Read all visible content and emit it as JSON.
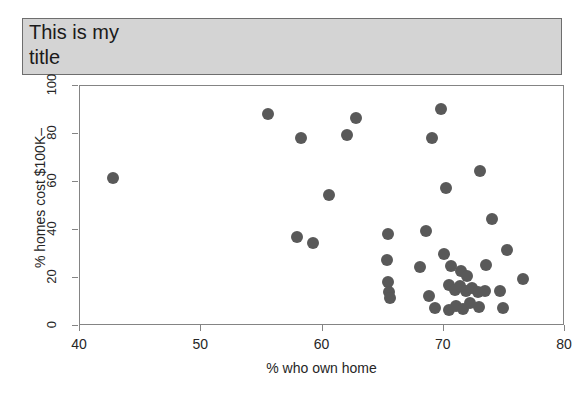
{
  "chart_data": {
    "type": "scatter",
    "title": "This is my\ntitle",
    "xlabel": "% who own home",
    "ylabel": "% homes cost $100K–",
    "xlim": [
      40,
      80
    ],
    "ylim": [
      0,
      100
    ],
    "xticks": [
      40,
      50,
      60,
      70,
      80
    ],
    "yticks": [
      0,
      20,
      40,
      60,
      80,
      100
    ],
    "grid": false,
    "legend": null,
    "marker": {
      "shape": "circle",
      "color": "#595959",
      "size": 12
    },
    "points": [
      {
        "x": 42.7,
        "y": 61.5
      },
      {
        "x": 55.5,
        "y": 88.5
      },
      {
        "x": 58.2,
        "y": 78.5
      },
      {
        "x": 62.0,
        "y": 79.5
      },
      {
        "x": 62.8,
        "y": 86.5
      },
      {
        "x": 69.8,
        "y": 90.5
      },
      {
        "x": 69.0,
        "y": 78.5
      },
      {
        "x": 73.0,
        "y": 64.5
      },
      {
        "x": 70.2,
        "y": 57.5
      },
      {
        "x": 60.5,
        "y": 54.5
      },
      {
        "x": 74.0,
        "y": 44.5
      },
      {
        "x": 57.9,
        "y": 37.0
      },
      {
        "x": 59.2,
        "y": 34.5
      },
      {
        "x": 65.4,
        "y": 38.5
      },
      {
        "x": 68.5,
        "y": 39.5
      },
      {
        "x": 65.3,
        "y": 27.5
      },
      {
        "x": 70.0,
        "y": 30.0
      },
      {
        "x": 75.2,
        "y": 31.5
      },
      {
        "x": 65.4,
        "y": 18.5
      },
      {
        "x": 68.0,
        "y": 24.5
      },
      {
        "x": 70.6,
        "y": 25.0
      },
      {
        "x": 71.4,
        "y": 23.0
      },
      {
        "x": 71.9,
        "y": 21.0
      },
      {
        "x": 73.5,
        "y": 25.5
      },
      {
        "x": 76.5,
        "y": 19.5
      },
      {
        "x": 65.5,
        "y": 14.0
      },
      {
        "x": 65.6,
        "y": 11.5
      },
      {
        "x": 68.8,
        "y": 12.5
      },
      {
        "x": 70.4,
        "y": 17.0
      },
      {
        "x": 70.9,
        "y": 15.0
      },
      {
        "x": 71.3,
        "y": 16.5
      },
      {
        "x": 71.8,
        "y": 14.5
      },
      {
        "x": 72.3,
        "y": 16.0
      },
      {
        "x": 72.8,
        "y": 14.0
      },
      {
        "x": 73.4,
        "y": 14.5
      },
      {
        "x": 74.6,
        "y": 14.5
      },
      {
        "x": 69.3,
        "y": 7.5
      },
      {
        "x": 70.4,
        "y": 6.5
      },
      {
        "x": 71.0,
        "y": 8.5
      },
      {
        "x": 71.6,
        "y": 7.0
      },
      {
        "x": 72.2,
        "y": 9.5
      },
      {
        "x": 72.9,
        "y": 8.0
      },
      {
        "x": 74.9,
        "y": 7.5
      }
    ]
  }
}
